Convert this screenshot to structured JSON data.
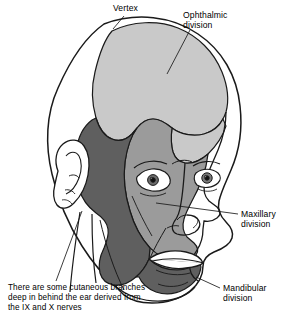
{
  "figure": {
    "view": "three-quarter right anterolateral view of head",
    "background_color": "#ffffff",
    "line_color": "#1a1a1a",
    "regions": [
      {
        "name": "ophthalmic-division-region",
        "label": "Ophthalmic division",
        "fill": "#c9c9c9",
        "tone": "light gray",
        "description": "scalp and forehead from vertex forward, upper eyelid and bridge of nose"
      },
      {
        "name": "maxillary-division-region",
        "label": "Maxillary division",
        "fill": "#9b9b9b",
        "tone": "medium gray",
        "description": "temple, cheek, lateral nose, upper lip and midface"
      },
      {
        "name": "mandibular-division-region",
        "label": "Mandibular division",
        "fill": "#5f5f5f",
        "tone": "dark gray",
        "description": "preauricular area, lower cheek, jaw, chin and lower lip"
      },
      {
        "name": "unshaded-region",
        "label": "",
        "fill": "#ffffff",
        "tone": "white",
        "description": "posterior scalp, neck, ear and far side of face"
      }
    ]
  },
  "labels": {
    "vertex": "Vertex",
    "ophthalmic": "Ophthalmic\ndivision",
    "maxillary": "Maxillary\ndivision",
    "mandibular": "Mandibular\ndivision",
    "caption": "There are some cutaneous branches\ndeep in behind the ear derived from\nthe IX and X nerves"
  },
  "leader_lines": [
    {
      "name": "vertex-leader",
      "from": "Vertex label",
      "to": "apex of scalp"
    },
    {
      "name": "ophthalmic-leader",
      "from": "Ophthalmic division label",
      "to": "light gray scalp area"
    },
    {
      "name": "maxillary-leader",
      "from": "Maxillary division label",
      "to": "cheek / nose region"
    },
    {
      "name": "mandibular-leader",
      "from": "Mandibular division label",
      "to": "dark gray jaw region"
    },
    {
      "name": "caption-leader",
      "from": "caption text",
      "to": "area behind the ear"
    }
  ]
}
